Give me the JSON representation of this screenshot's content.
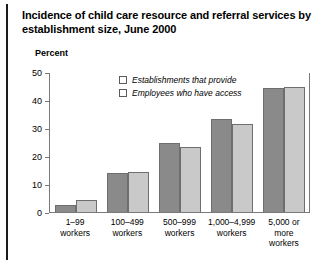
{
  "chart_data": {
    "type": "bar",
    "title": "Incidence of child care resource and referral services by establishment size, June 2000",
    "xlabel": "",
    "ylabel": "Percent",
    "ylim": [
      0,
      50
    ],
    "yticks": [
      0,
      10,
      20,
      30,
      40,
      50
    ],
    "ytick_labels": [
      "0",
      "10",
      "20",
      "30",
      "40",
      "50"
    ],
    "grid": false,
    "legend_position": "top-center-inside",
    "categories": [
      "1–99\nworkers",
      "100–499\nworkers",
      "500–999\nworkers",
      "1,000–4,999\nworkers",
      "5,000 or\nmore\nworkers"
    ],
    "series": [
      {
        "name": "Establishments that provide",
        "color": "#8a8a8a",
        "values": [
          2.5,
          14.0,
          25.0,
          33.5,
          44.5
        ]
      },
      {
        "name": "Employees who have access",
        "color": "#c9c9c9",
        "values": [
          4.5,
          14.5,
          23.5,
          31.5,
          45.0
        ]
      }
    ]
  }
}
